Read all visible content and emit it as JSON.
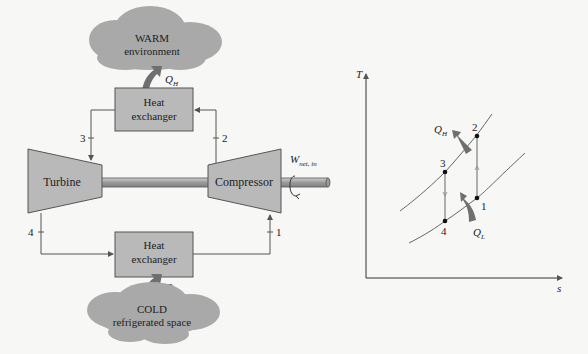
{
  "schematic": {
    "warm_cloud": {
      "line1": "WARM",
      "line2": "environment"
    },
    "cold_cloud": {
      "line1": "COLD",
      "line2": "refrigerated space"
    },
    "hx_top": {
      "line1": "Heat",
      "line2": "exchanger"
    },
    "hx_bottom": {
      "line1": "Heat",
      "line2": "exchanger"
    },
    "turbine": "Turbine",
    "compressor": "Compressor",
    "work": {
      "symbol": "W",
      "subscript": "net, in"
    },
    "q_high": {
      "symbol": "Q",
      "subscript": "H"
    },
    "q_low": {
      "symbol": "Q",
      "subscript": "L"
    },
    "state_labels": {
      "s1": "1",
      "s2": "2",
      "s3": "3",
      "s4": "4"
    }
  },
  "ts_diagram": {
    "y_axis_label": "T",
    "x_axis_label": "s",
    "points": {
      "p1": "1",
      "p2": "2",
      "p3": "3",
      "p4": "4"
    },
    "q_high": {
      "symbol": "Q",
      "subscript": "H"
    },
    "q_low": {
      "symbol": "Q",
      "subscript": "L"
    }
  },
  "colors": {
    "background": "#f7f7f5",
    "component_fill": "#b9b9b9",
    "cloud_fill": "#a8a8a8",
    "arrow_fill": "#6f6f6f",
    "line": "#555555"
  }
}
